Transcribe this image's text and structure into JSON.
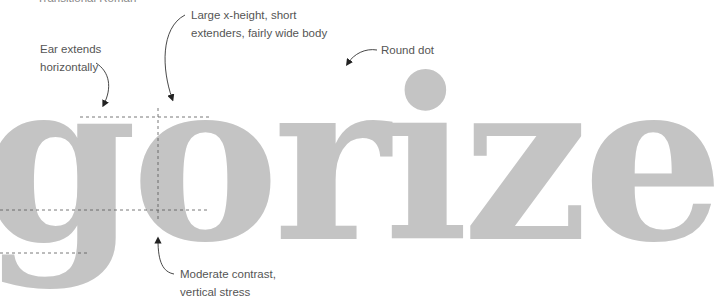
{
  "title_partial": "Transitional Roman",
  "specimen_word": "gorize",
  "annotations": [
    {
      "id": "ear",
      "text": "Ear extends horizontally",
      "lines": [
        "Ear extends",
        "horizontally"
      ]
    },
    {
      "id": "xheight",
      "text": "Large x-height, short extenders, fairly wide body",
      "lines": [
        "Large x-height, short",
        "extenders, fairly wide body"
      ]
    },
    {
      "id": "dot",
      "text": "Round dot",
      "lines": [
        "Round dot"
      ]
    },
    {
      "id": "contrast",
      "text": "Moderate contrast, vertical stress",
      "lines": [
        "Moderate contrast,",
        "vertical stress"
      ]
    }
  ],
  "colors": {
    "glyph": "#c4c4c4",
    "text": "#555555",
    "line": "#333333"
  }
}
